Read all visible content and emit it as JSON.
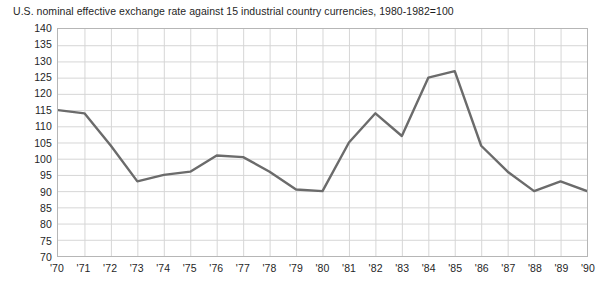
{
  "chart_data": {
    "type": "line",
    "title": "U.S. nominal effective exchange rate against 15 industrial country currencies, 1980-1982=100",
    "xlabel": "",
    "ylabel": "",
    "ylim": [
      70,
      140
    ],
    "ytick_step": 5,
    "yticks": [
      140,
      135,
      130,
      125,
      120,
      115,
      110,
      105,
      100,
      95,
      90,
      85,
      80,
      75,
      70
    ],
    "ytick_labels": [
      "140",
      "135",
      "130",
      "125",
      "120",
      "115",
      "110",
      "105",
      "100",
      "95",
      "90",
      "85",
      "80",
      "75",
      "70"
    ],
    "categories": [
      "'70",
      "'71",
      "'72",
      "'73",
      "'74",
      "'75",
      "'76",
      "'77",
      "'78",
      "'79",
      "'80",
      "'81",
      "'82",
      "'83",
      "'84",
      "'85",
      "'86",
      "'87",
      "'88",
      "'89",
      "'90"
    ],
    "x": [
      1970,
      1971,
      1972,
      1973,
      1974,
      1975,
      1976,
      1977,
      1978,
      1979,
      1980,
      1981,
      1982,
      1983,
      1984,
      1985,
      1986,
      1987,
      1988,
      1989,
      1990
    ],
    "values": [
      115,
      114,
      104,
      93,
      95,
      96,
      101,
      100.5,
      96,
      90.5,
      90,
      105,
      114,
      107,
      125,
      127,
      104,
      96,
      90,
      93,
      90
    ],
    "series": [
      {
        "name": "U.S. nominal effective exchange rate",
        "values": [
          115,
          114,
          104,
          93,
          95,
          96,
          101,
          100.5,
          96,
          90.5,
          90,
          105,
          114,
          107,
          125,
          127,
          104,
          96,
          90,
          93,
          90
        ]
      }
    ],
    "grid": true,
    "grid_color": "#d6d6d6",
    "line_color": "#6b6b6b",
    "line_width": 2.4,
    "frame_color": "#b6b6b6",
    "legend": false,
    "legend_position": "none",
    "markers": false,
    "background_color": "#ffffff"
  }
}
